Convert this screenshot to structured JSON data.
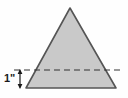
{
  "figure": {
    "background_color": "#fefefe"
  },
  "chart_data": {
    "type": "diagram",
    "xlabel": "",
    "ylabel": "",
    "grid": false,
    "legend": null,
    "shapes": [
      {
        "name": "triangle",
        "kind": "polygon",
        "points": [
          [
            70,
            8
          ],
          [
            116,
            88
          ],
          [
            26,
            88
          ]
        ],
        "fill_color": "#c9c9c9",
        "stroke_color": "#555555",
        "stroke_width": 1.6
      },
      {
        "name": "cut-line",
        "kind": "dashed-line",
        "x1": 14,
        "y1": 70,
        "x2": 124,
        "y2": 70,
        "stroke_color": "#333333",
        "stroke_width": 1.2,
        "dash_pattern": "6 4"
      },
      {
        "name": "dimension-arrow",
        "kind": "double-arrow-vertical",
        "x": 20,
        "y_top": 70,
        "y_bottom": 88,
        "stroke_color": "#1a1a1a",
        "stroke_width": 1.2
      }
    ],
    "annotations": [
      {
        "name": "height-dimension",
        "text": "1\"",
        "x": 5,
        "y": 79,
        "value": 1,
        "unit": "inch",
        "color": "#1a1a1a"
      }
    ]
  },
  "labels": {
    "height_dimension": "1\""
  },
  "colors": {
    "shape_fill": "#c9c9c9",
    "shape_stroke": "#555555",
    "dash_stroke": "#333333",
    "text": "#1a1a1a",
    "background": "#fefefe"
  }
}
